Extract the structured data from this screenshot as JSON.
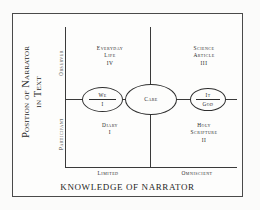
{
  "figure": {
    "type": "conceptual-matrix",
    "y_axis": {
      "title_lines": [
        "Position of Narrator",
        "in Text"
      ],
      "pole_high": "Observer",
      "pole_low": "Participant"
    },
    "x_axis": {
      "title": "KNOWLEDGE OF NARRATOR",
      "tick_low": "Limited",
      "tick_high": "Omniscient"
    },
    "quadrants": [
      {
        "id": "upper-left",
        "lines": [
          "Everyday",
          "Life",
          "IV"
        ]
      },
      {
        "id": "upper-right",
        "lines": [
          "Science",
          "Article",
          "III"
        ]
      },
      {
        "id": "lower-left",
        "lines": [
          "Diary",
          "I"
        ]
      },
      {
        "id": "lower-right",
        "lines": [
          "Holy",
          "Scripture",
          "II"
        ]
      }
    ],
    "nodes": [
      {
        "id": "we-i",
        "top": "We",
        "bottom": "I",
        "divided": true
      },
      {
        "id": "care",
        "top": "Care",
        "bottom": "",
        "divided": false
      },
      {
        "id": "it-god",
        "top": "It",
        "bottom": "God",
        "divided": true
      }
    ],
    "colors": {
      "ink": "#2a2a2a",
      "line": "#3a3a3a",
      "frame": "#4a4a4a",
      "background": "#fdfdfc"
    }
  },
  "chart_data": {
    "type": "scatter",
    "title": "",
    "xlabel": "KNOWLEDGE OF NARRATOR",
    "ylabel": "Position of Narrator in Text",
    "x_ticks": [
      "Limited",
      "Omniscient"
    ],
    "y_ticks": [
      "Participant",
      "Observer"
    ],
    "annotations": [
      "Everyday Life IV",
      "Science Article III",
      "Diary I",
      "Holy Scripture II",
      "We / I",
      "Care",
      "It / God"
    ]
  }
}
